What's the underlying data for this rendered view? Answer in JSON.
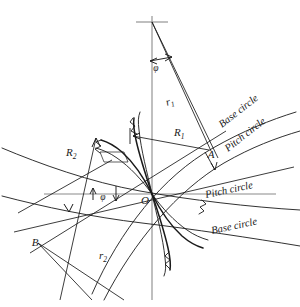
{
  "figure": {
    "background_color": "#ffffff",
    "line_color": "#1a1a1a",
    "axis_color": "#8a8a8a"
  },
  "points": [
    {
      "id": "pitch-point",
      "label": "O",
      "x": 152,
      "y": 194
    },
    {
      "id": "point-a",
      "label": "A",
      "x": 213,
      "y": 152
    },
    {
      "id": "point-b",
      "label": "B",
      "x": 38,
      "y": 243
    },
    {
      "id": "center-1",
      "label": "",
      "x": 152,
      "y": 22
    }
  ],
  "dimensions": [
    {
      "id": "r1",
      "base": "r",
      "sub": "1",
      "x": 169,
      "y": 104
    },
    {
      "id": "R1",
      "base": "R",
      "sub": "1",
      "x": 178,
      "y": 133
    },
    {
      "id": "R2",
      "base": "R",
      "sub": "2",
      "x": 72,
      "y": 152
    },
    {
      "id": "r2",
      "base": "r",
      "sub": "2",
      "x": 101,
      "y": 256
    }
  ],
  "angles": [
    {
      "id": "phi-upper",
      "label": "φ",
      "x": 158,
      "y": 70
    },
    {
      "id": "phi-lower",
      "label": "φ",
      "x": 101,
      "y": 199
    }
  ],
  "curve_labels": [
    {
      "id": "base-circle-upper",
      "text": "Base circle",
      "x": 222,
      "y": 128,
      "rotate": -38
    },
    {
      "id": "pitch-circle-upper",
      "text": "Pitch circle",
      "x": 230,
      "y": 152,
      "rotate": -38
    },
    {
      "id": "pitch-circle-lower",
      "text": "Pitch circle",
      "x": 218,
      "y": 196,
      "rotate": -14
    },
    {
      "id": "base-circle-lower",
      "text": "Base circle",
      "x": 222,
      "y": 232,
      "rotate": -14
    }
  ]
}
